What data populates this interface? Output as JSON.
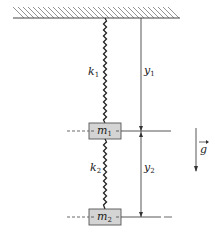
{
  "diagram": {
    "ceiling": {
      "label": ""
    },
    "springs": [
      {
        "id": "k1",
        "symbol": "k",
        "subscript": "1"
      },
      {
        "id": "k2",
        "symbol": "k",
        "subscript": "2"
      }
    ],
    "masses": [
      {
        "id": "m1",
        "symbol": "m",
        "subscript": "1"
      },
      {
        "id": "m2",
        "symbol": "m",
        "subscript": "2"
      }
    ],
    "coordinates": [
      {
        "id": "y1",
        "symbol": "y",
        "subscript": "1"
      },
      {
        "id": "y2",
        "symbol": "y",
        "subscript": "2"
      }
    ],
    "gravity": {
      "symbol": "g",
      "vector": true
    },
    "colors": {
      "line": "#333333",
      "mass_fill": "#d4d4d4",
      "mass_stroke": "#555555",
      "hatch": "#666666"
    }
  }
}
